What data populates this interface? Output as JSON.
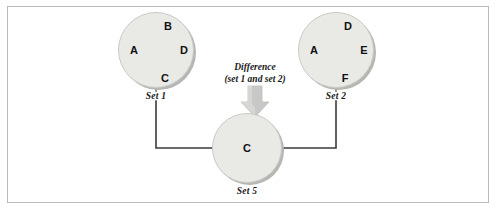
{
  "figure": {
    "background_color": "#ffffff",
    "frame_color": "#b9bbbd",
    "node_fill": "#e9e9e6",
    "node_stroke": "#c9c9c5",
    "connector_color": "#3a3a3a",
    "arrow_color": "#c3c3c1"
  },
  "operation": {
    "name": "Difference",
    "operands": "(set 1 and set 2)"
  },
  "nodes": [
    {
      "id": "set1",
      "caption": "Set 1",
      "elements": [
        {
          "label": "B",
          "x": 50,
          "y": 14
        },
        {
          "label": "A",
          "x": 16,
          "y": 38
        },
        {
          "label": "D",
          "x": 66,
          "y": 38
        },
        {
          "label": "C",
          "x": 47,
          "y": 66
        }
      ]
    },
    {
      "id": "set2",
      "caption": "Set 2",
      "elements": [
        {
          "label": "D",
          "x": 50,
          "y": 14
        },
        {
          "label": "A",
          "x": 16,
          "y": 38
        },
        {
          "label": "E",
          "x": 66,
          "y": 38
        },
        {
          "label": "F",
          "x": 47,
          "y": 66
        }
      ]
    },
    {
      "id": "set5",
      "caption": "Set 5",
      "elements": [
        {
          "label": "C",
          "x": 35,
          "y": 35
        }
      ]
    }
  ]
}
